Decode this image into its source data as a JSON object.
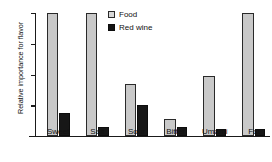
{
  "chart_data": {
    "type": "bar",
    "title": "",
    "xlabel": "",
    "ylabel": "Relative importance for flavor",
    "categories": [
      "Sweet",
      "Salt",
      "Sour",
      "Bitter",
      "Umami",
      "Fat"
    ],
    "series": [
      {
        "name": "Food",
        "color": "#c9c9c9",
        "values": [
          1.0,
          1.0,
          0.42,
          0.14,
          0.49,
          1.0
        ]
      },
      {
        "name": "Red wine",
        "color": "#171717",
        "values": [
          0.19,
          0.07,
          0.25,
          0.07,
          0.06,
          0.06
        ]
      }
    ],
    "ylim": [
      0,
      1.0
    ],
    "y_tick_values": [
      0,
      0.25,
      0.5,
      0.75,
      1.0
    ],
    "y_tick_labels": [
      "",
      "",
      "",
      "",
      ""
    ],
    "grid": false,
    "legend_position": "top-center"
  },
  "axes": {
    "y_title": "Relative importance for flavor"
  },
  "legend": {
    "entries": [
      {
        "label": "Food",
        "swatch": "light-gray-square"
      },
      {
        "label": "Red wine",
        "swatch": "black-square"
      }
    ]
  },
  "ticks": {
    "x": [
      "Sweet",
      "Salt",
      "Sour",
      "Bitter",
      "Umami",
      "Fat"
    ]
  }
}
